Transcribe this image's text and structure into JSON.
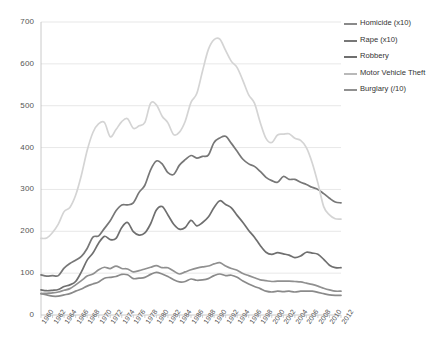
{
  "chart_data": {
    "type": "line",
    "title": "",
    "xlabel": "",
    "ylabel": "",
    "ylim": [
      0,
      700
    ],
    "ytick_step": 100,
    "grid": true,
    "legend_position": "right",
    "yticks": [
      "0",
      "100",
      "200",
      "300",
      "400",
      "500",
      "600",
      "700"
    ],
    "x": [
      1960,
      1961,
      1962,
      1963,
      1964,
      1965,
      1966,
      1967,
      1968,
      1969,
      1970,
      1971,
      1972,
      1973,
      1974,
      1975,
      1976,
      1977,
      1978,
      1979,
      1980,
      1981,
      1982,
      1983,
      1984,
      1985,
      1986,
      1987,
      1988,
      1989,
      1990,
      1991,
      1992,
      1993,
      1994,
      1995,
      1996,
      1997,
      1998,
      1999,
      2000,
      2001,
      2002,
      2003,
      2004,
      2005,
      2006,
      2007,
      2008,
      2009,
      2010,
      2011,
      2012
    ],
    "xticks": [
      "1960",
      "1962",
      "1964",
      "1966",
      "1968",
      "1970",
      "1972",
      "1974",
      "1976",
      "1978",
      "1980",
      "1982",
      "1984",
      "1986",
      "1988",
      "1990",
      "1992",
      "1994",
      "1996",
      "1998",
      "2000",
      "2002",
      "2004",
      "2006",
      "2008",
      "2010",
      "2012"
    ],
    "series": [
      {
        "name": "Homicide (x10)",
        "color": "#8a8a8a",
        "values": [
          51,
          48,
          45,
          45,
          48,
          51,
          57,
          62,
          69,
          74,
          79,
          88,
          90,
          92,
          97,
          96,
          87,
          88,
          90,
          97,
          102,
          98,
          92,
          84,
          79,
          80,
          86,
          83,
          84,
          87,
          94,
          98,
          94,
          95,
          90,
          81,
          74,
          68,
          63,
          57,
          55,
          57,
          56,
          57,
          55,
          57,
          57,
          57,
          54,
          51,
          48,
          47,
          47
        ]
      },
      {
        "name": "Rape (x10)",
        "color": "#777777",
        "values": [
          96,
          93,
          94,
          94,
          112,
          123,
          131,
          140,
          159,
          186,
          189,
          207,
          225,
          249,
          263,
          263,
          268,
          293,
          310,
          347,
          368,
          361,
          340,
          336,
          358,
          371,
          381,
          375,
          379,
          382,
          412,
          423,
          427,
          410,
          391,
          372,
          361,
          355,
          343,
          329,
          321,
          317,
          331,
          324,
          324,
          317,
          312,
          305,
          300,
          290,
          279,
          270,
          268
        ]
      },
      {
        "name": "Robbery",
        "color": "#6f6f6f",
        "values": [
          60,
          58,
          59,
          61,
          68,
          72,
          80,
          103,
          131,
          148,
          172,
          188,
          180,
          183,
          209,
          221,
          199,
          191,
          196,
          218,
          251,
          259,
          239,
          217,
          205,
          209,
          226,
          213,
          221,
          234,
          257,
          273,
          264,
          256,
          238,
          221,
          202,
          186,
          166,
          150,
          145,
          149,
          146,
          143,
          137,
          141,
          150,
          148,
          145,
          133,
          119,
          113,
          113
        ]
      },
      {
        "name": "Motor Vehicle Theft",
        "color": "#d4d4d4",
        "values": [
          183,
          184,
          197,
          217,
          247,
          257,
          286,
          334,
          393,
          436,
          457,
          460,
          426,
          443,
          462,
          469,
          446,
          452,
          460,
          506,
          502,
          475,
          459,
          431,
          437,
          463,
          508,
          529,
          583,
          634,
          658,
          659,
          632,
          606,
          591,
          560,
          526,
          506,
          460,
          422,
          412,
          430,
          432,
          433,
          422,
          417,
          400,
          364,
          315,
          259,
          239,
          230,
          229
        ]
      },
      {
        "name": "Burglary (/10)",
        "color": "#909090",
        "values": [
          51,
          52,
          53,
          55,
          59,
          63,
          72,
          82,
          93,
          98,
          108,
          114,
          111,
          117,
          111,
          110,
          103,
          106,
          110,
          114,
          118,
          113,
          113,
          105,
          98,
          103,
          108,
          112,
          115,
          117,
          122,
          125,
          117,
          111,
          107,
          99,
          94,
          89,
          84,
          82,
          80,
          81,
          81,
          81,
          80,
          79,
          76,
          73,
          69,
          64,
          60,
          57,
          57
        ]
      }
    ]
  },
  "legend": {
    "items": [
      {
        "label": "Homicide (x10)",
        "color": "#8a8a8a"
      },
      {
        "label": "Rape (x10)",
        "color": "#777777"
      },
      {
        "label": "Robbery",
        "color": "#6f6f6f"
      },
      {
        "label": "Motor Vehicle Theft",
        "color": "#b9b9b9"
      },
      {
        "label": "Burglary (/10)",
        "color": "#909090"
      }
    ]
  }
}
